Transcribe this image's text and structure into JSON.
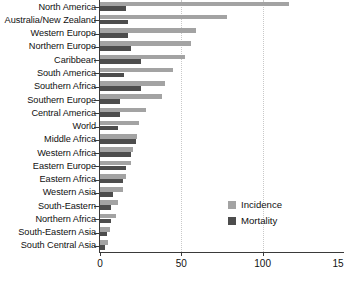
{
  "chart_data": {
    "type": "bar",
    "orientation": "horizontal",
    "title": "",
    "xlabel": "",
    "ylabel": "",
    "xlim": [
      0,
      150
    ],
    "xticks": [
      0,
      50,
      100,
      150
    ],
    "xtick_labels": [
      "0",
      "50",
      "100",
      "15"
    ],
    "grid": "vertical-dotted",
    "legend_position": "inside-right-lower",
    "categories": [
      "North America",
      "Australia/New Zealand",
      "Western Europe",
      "Northern Europe",
      "Caribbean",
      "South America",
      "Southern Africa",
      "Southern Europe",
      "Central America",
      "World",
      "Middle Africa",
      "Western Africa",
      "Eastern Europe",
      "Eastern Africa",
      "Western Asia",
      "South-Eastern",
      "Northern Africa",
      "South-Eastern Asia",
      "South Central Asia"
    ],
    "series": [
      {
        "name": "Incidence",
        "color": "#a3a3a3",
        "values": [
          116,
          78,
          59,
          56,
          52,
          45,
          40,
          38,
          28,
          24,
          23,
          20,
          19,
          16,
          14,
          11,
          10,
          6,
          5
        ]
      },
      {
        "name": "Mortality",
        "color": "#4d4d4d",
        "values": [
          16,
          17,
          17,
          19,
          25,
          15,
          25,
          12,
          12,
          11,
          22,
          19,
          16,
          14,
          8,
          7,
          7,
          4,
          3
        ]
      }
    ]
  },
  "legend": {
    "items": [
      {
        "label": "Incidence",
        "color": "#a3a3a3"
      },
      {
        "label": "Mortality",
        "color": "#4d4d4d"
      }
    ]
  }
}
